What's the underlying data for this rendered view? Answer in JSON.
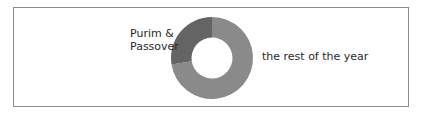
{
  "chart_data": {
    "type": "pie",
    "subtype": "donut",
    "title": "",
    "categories": [
      "Purim & Passover",
      "the rest of the year"
    ],
    "values": [
      27.5,
      72.5
    ],
    "unit": "percent (estimated)",
    "colors": [
      "#646464",
      "#8a8a8a"
    ],
    "start_angle_deg": 0,
    "direction": "clockwise from 'the rest of the year', Purim & Passover occupies the upper-left quadrant ending at 12 o'clock",
    "legend": "none (direct labels)",
    "annotations": [
      {
        "text": "Purim &\nPassover",
        "position": "upper-left of donut"
      },
      {
        "text": "the rest of the year",
        "position": "right of donut"
      }
    ]
  },
  "labels": {
    "purim_line1": "Purim &",
    "purim_line2": "Passover",
    "rest": "the rest of the year"
  },
  "colors": {
    "frame_border": "#8a8a8a",
    "slice_purim": "#646464",
    "slice_rest": "#8a8a8a",
    "text": "#2a2a2a"
  }
}
